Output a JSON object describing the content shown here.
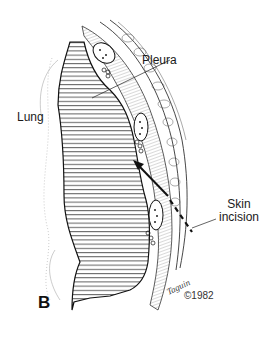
{
  "figure": {
    "panel_letter": "B",
    "labels": {
      "lung": "Lung",
      "pleura": "Pleura",
      "skin_incision_line1": "Skin",
      "skin_incision_line2": "incision"
    },
    "signature": "Taguin",
    "copyright": "©1982",
    "colors": {
      "ink": "#1a1a1a",
      "background": "#ffffff"
    }
  }
}
